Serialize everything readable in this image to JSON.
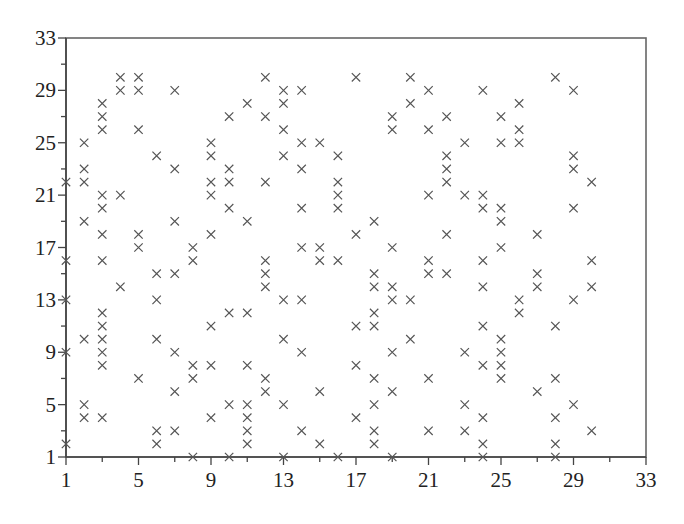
{
  "chart_data": {
    "type": "scatter",
    "title": "",
    "xlabel": "",
    "ylabel": "",
    "marker": "x",
    "marker_color": "#555555",
    "xlim": [
      1,
      33
    ],
    "ylim": [
      1,
      33
    ],
    "x_ticks": [
      1,
      5,
      9,
      13,
      17,
      21,
      25,
      29,
      33
    ],
    "y_ticks": [
      1,
      5,
      9,
      13,
      17,
      21,
      25,
      29,
      33
    ],
    "minor_tick_step": 2,
    "grid": false,
    "legend": null,
    "points_by_x": {
      "1": [
        22,
        16,
        13,
        9,
        2
      ],
      "2": [
        25,
        23,
        22,
        19,
        10,
        5,
        4
      ],
      "3": [
        28,
        27,
        26,
        21,
        20,
        18,
        16,
        12,
        11,
        10,
        9,
        8,
        4
      ],
      "4": [
        30,
        29,
        21,
        14
      ],
      "5": [
        30,
        29,
        26,
        18,
        17,
        7
      ],
      "6": [
        24,
        15,
        13,
        10,
        3,
        2
      ],
      "7": [
        29,
        23,
        19,
        15,
        9,
        6,
        3
      ],
      "8": [
        17,
        16,
        8,
        7,
        1
      ],
      "9": [
        25,
        24,
        22,
        21,
        18,
        11,
        8,
        4
      ],
      "10": [
        27,
        23,
        22,
        20,
        12,
        5,
        1
      ],
      "11": [
        28,
        19,
        12,
        8,
        5,
        4,
        3,
        2
      ],
      "12": [
        30,
        27,
        22,
        16,
        15,
        14,
        7,
        6
      ],
      "13": [
        29,
        28,
        26,
        24,
        13,
        10,
        5,
        1
      ],
      "14": [
        29,
        25,
        23,
        20,
        17,
        13,
        9,
        3
      ],
      "15": [
        25,
        17,
        16,
        6,
        2
      ],
      "16": [
        24,
        22,
        21,
        20,
        16,
        1
      ],
      "17": [
        30,
        18,
        11,
        8,
        4
      ],
      "18": [
        19,
        15,
        14,
        12,
        11,
        7,
        5,
        3,
        2
      ],
      "19": [
        27,
        26,
        17,
        14,
        13,
        9,
        6,
        1
      ],
      "20": [
        30,
        28,
        13,
        10
      ],
      "21": [
        29,
        26,
        21,
        16,
        15,
        7,
        3
      ],
      "22": [
        27,
        24,
        23,
        22,
        18,
        15
      ],
      "23": [
        25,
        21,
        9,
        5,
        3
      ],
      "24": [
        29,
        21,
        20,
        16,
        14,
        11,
        8,
        4,
        2,
        1
      ],
      "25": [
        27,
        25,
        20,
        19,
        17,
        10,
        9,
        8,
        7
      ],
      "26": [
        28,
        26,
        25,
        13,
        12
      ],
      "27": [
        18,
        15,
        14,
        6
      ],
      "28": [
        30,
        11,
        7,
        4,
        2,
        1
      ],
      "29": [
        29,
        24,
        23,
        20,
        13,
        5
      ],
      "30": [
        22,
        16,
        14,
        3
      ]
    }
  }
}
